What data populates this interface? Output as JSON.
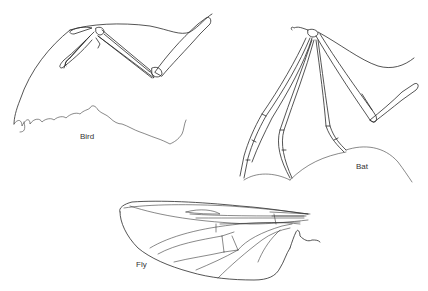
{
  "figure": {
    "panels": [
      {
        "id": "bird",
        "label": "Bird"
      },
      {
        "id": "bat",
        "label": "Bat"
      },
      {
        "id": "fly",
        "label": "Fly"
      }
    ]
  },
  "colors": {
    "background": "#ffffff",
    "line": "#2a2a2a",
    "text": "#333333"
  }
}
